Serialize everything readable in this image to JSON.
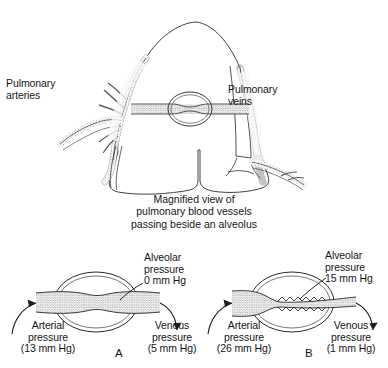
{
  "figure": {
    "title_caption": "Magnified view of\npulmonary blood vessels\npassing beside an alveolus",
    "top_diagram": {
      "name": "lung-with-pulmonary-vessels",
      "left_label": "Pulmonary\narteries",
      "right_label": "Pulmonary\nveins"
    },
    "panels": [
      {
        "letter": "A",
        "alveolar_label": "Alveolar\npressure\n0 mm Hg",
        "alveolar_pressure_value": "0 mm Hg",
        "arterial_label": "Arterial\npressure\n(13 mm Hg)",
        "arterial_pressure_value": "13 mm Hg",
        "venous_label": "Venous\npressure\n(5 mm Hg)",
        "venous_pressure_value": "5 mm Hg",
        "vessel_state": "open"
      },
      {
        "letter": "B",
        "alveolar_label": "Alveolar\npressure\n15 mm Hg",
        "alveolar_pressure_value": "15 mm Hg",
        "arterial_label": "Arterial\npressure\n(26 mm Hg)",
        "arterial_pressure_value": "26 mm Hg",
        "venous_label": "Venous\npressure\n(1 mm Hg)",
        "venous_pressure_value": "1 mm Hg",
        "vessel_state": "collapsed"
      }
    ],
    "colors": {
      "ink": "#1a1a1a",
      "stipple": "#6e6e6e",
      "background": "#ffffff"
    }
  }
}
